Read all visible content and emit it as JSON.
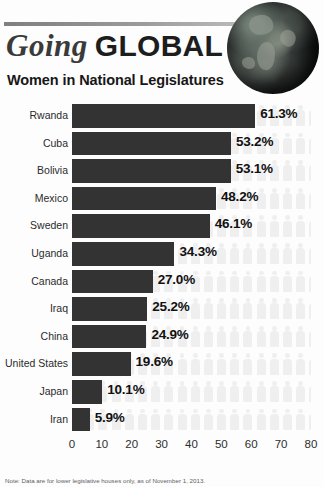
{
  "header": {
    "title_italic": "Going",
    "title_bold": "GLOBAL",
    "subtitle": "Women in National Legislatures",
    "globe_icon": "globe-icon"
  },
  "footnote": "Note: Data are for lower legislative houses only, as of November 1, 2013.",
  "colors": {
    "bar": "#333333",
    "people": "#e2e2e2",
    "text": "#111111",
    "label": "#2b2b2b",
    "rule": "#8c8c8c"
  },
  "chart_data": {
    "type": "bar",
    "orientation": "horizontal",
    "title": "Women in National Legislatures",
    "xlabel": "",
    "ylabel": "",
    "xlim": [
      0,
      80
    ],
    "grid": false,
    "legend": "none",
    "xticks": [
      0,
      10,
      20,
      30,
      40,
      50,
      60,
      70,
      80
    ],
    "categories": [
      "Rwanda",
      "Cuba",
      "Bolivia",
      "Mexico",
      "Sweden",
      "Uganda",
      "Canada",
      "Iraq",
      "China",
      "United States",
      "Japan",
      "Iran"
    ],
    "values": [
      61.3,
      53.2,
      53.1,
      48.2,
      46.1,
      34.3,
      27.0,
      25.2,
      24.9,
      19.6,
      10.1,
      5.9
    ],
    "value_labels": [
      "61.3%",
      "53.2%",
      "53.1%",
      "48.2%",
      "46.1%",
      "34.3%",
      "27.0%",
      "25.2%",
      "24.9%",
      "19.6%",
      "10.1%",
      "5.9%"
    ]
  }
}
